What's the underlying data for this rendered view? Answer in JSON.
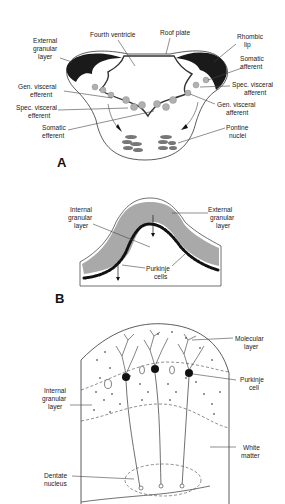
{
  "figure": {
    "panels": [
      {
        "id": "A",
        "letter": "A",
        "labels": {
          "fourth_ventricle": "Fourth ventricle",
          "roof_plate": "Roof plate",
          "external_granular_1": "External",
          "external_granular_2": "granular",
          "external_granular_3": "layer",
          "rhombic_lip_1": "Rhombic",
          "rhombic_lip_2": "lip",
          "somatic_afferent_1": "Somatic",
          "somatic_afferent_2": "afferent",
          "spec_visceral_afferent_1": "Spec. visceral",
          "spec_visceral_afferent_2": "afferent",
          "gen_visceral_afferent_1": "Gen. visceral",
          "gen_visceral_afferent_2": "afferent",
          "gen_visceral_efferent_1": "Gen. visceral",
          "gen_visceral_efferent_2": "efferent",
          "spec_visceral_efferent_1": "Spec. visceral",
          "spec_visceral_efferent_2": "efferent",
          "somatic_efferent_1": "Somatic",
          "somatic_efferent_2": "efferent",
          "pontine_nuclei_1": "Pontine",
          "pontine_nuclei_2": "nuclei"
        }
      },
      {
        "id": "B",
        "letter": "B",
        "labels": {
          "internal_granular_1": "Internal",
          "internal_granular_2": "granular",
          "internal_granular_3": "layer",
          "external_granular_1": "External",
          "external_granular_2": "granular",
          "external_granular_3": "layer",
          "purkinje_1": "Purkinje",
          "purkinje_2": "cells"
        }
      },
      {
        "id": "C",
        "labels": {
          "molecular_layer_1": "Molecular",
          "molecular_layer_2": "layer",
          "purkinje_cell_1": "Purkinje",
          "purkinje_cell_2": "cell",
          "internal_granular_1": "Internal",
          "internal_granular_2": "granular",
          "internal_granular_3": "layer",
          "white_matter_1": "White",
          "white_matter_2": "matter",
          "dentate_nucleus_1": "Dentate",
          "dentate_nucleus_2": "nucleus"
        }
      }
    ],
    "colors": {
      "line": "#333333",
      "dark_fill": "#1a1a1a",
      "grey_cell": "#8a8a8a",
      "background": "#ffffff"
    }
  }
}
